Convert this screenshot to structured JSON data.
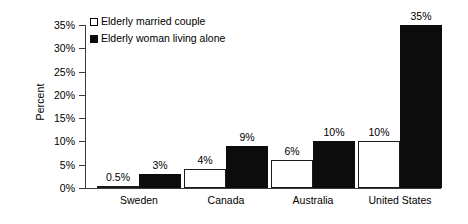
{
  "chart_data": {
    "type": "bar",
    "title": "",
    "subtitle": "",
    "xlabel": "",
    "ylabel": "Percent",
    "categories": [
      "Sweden",
      "Canada",
      "Australia",
      "United States"
    ],
    "series": [
      {
        "name": "Elderly married couple",
        "style": "open",
        "color": "#ffffff",
        "edge_color": "#000000",
        "values": [
          0.5,
          4,
          6,
          10
        ],
        "labels": [
          "0.5%",
          "4%",
          "6%",
          "10%"
        ]
      },
      {
        "name": "Elderly woman living alone",
        "style": "filled",
        "color": "#0c0c0c",
        "edge_color": "#0c0c0c",
        "values": [
          3,
          9,
          10,
          35
        ],
        "labels": [
          "3%",
          "9%",
          "10%",
          "35%"
        ]
      }
    ],
    "ylim": [
      0,
      35
    ],
    "ytick_values": [
      0,
      5,
      10,
      15,
      20,
      25,
      30,
      35
    ],
    "ytick_labels": [
      "0%",
      "5%",
      "10%",
      "15%",
      "20%",
      "25%",
      "30%",
      "35%"
    ],
    "grid": false,
    "legend_position": "top-left",
    "legend_entries": [
      "Elderly married couple",
      "Elderly woman living alone"
    ]
  },
  "axis": {
    "y_title": "Percent"
  }
}
